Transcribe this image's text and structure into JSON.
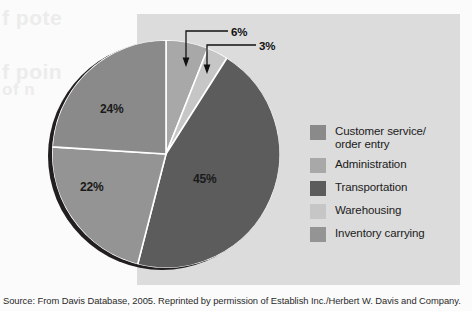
{
  "figure": {
    "background_panel_color": "#dcdcdc",
    "page_color": "#fbfbfb",
    "source_note": "Source: From Davis Database, 2005. Reprinted by permission of Establish Inc./Herbert W. Davis and Company."
  },
  "ghost_text": {
    "line1": "f pote",
    "line2": "f poin",
    "line3": "of n"
  },
  "chart_data": {
    "type": "pie",
    "title": "",
    "categories": [
      "Customer service/ order entry",
      "Administration",
      "Transportation",
      "Warehousing",
      "Inventory carrying"
    ],
    "values": [
      24,
      6,
      45,
      3,
      22
    ],
    "value_labels": [
      "24%",
      "6%",
      "45%",
      "3%",
      "22%"
    ],
    "colors": [
      "#8a8a8a",
      "#a8a8a8",
      "#5c5c5c",
      "#c6c6c6",
      "#949494"
    ],
    "slice_order_clockwise_from_top": [
      "Administration",
      "Warehousing",
      "Transportation",
      "Inventory carrying",
      "Customer service/ order entry"
    ],
    "legend_position": "right",
    "grid": false,
    "start_angle_deg": 0,
    "direction": "clockwise",
    "slice_border_color": "#ffffff",
    "shadow_color": "#231f20"
  },
  "slice_labels": {
    "transportation": "45%",
    "customer_service": "24%",
    "inventory_carrying": "22%"
  },
  "callouts": [
    {
      "label": "6%",
      "target": "Administration"
    },
    {
      "label": "3%",
      "target": "Warehousing"
    }
  ],
  "legend": {
    "items": [
      {
        "label": "Customer service/",
        "label2": "order entry",
        "color": "#8a8a8a"
      },
      {
        "label": "Administration",
        "label2": "",
        "color": "#a8a8a8"
      },
      {
        "label": "Transportation",
        "label2": "",
        "color": "#5c5c5c"
      },
      {
        "label": "Warehousing",
        "label2": "",
        "color": "#c6c6c6"
      },
      {
        "label": "Inventory carrying",
        "label2": "",
        "color": "#949494"
      }
    ]
  }
}
